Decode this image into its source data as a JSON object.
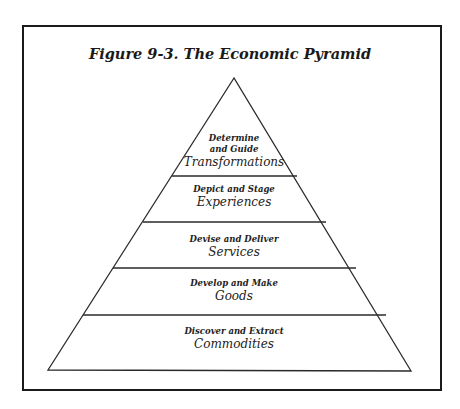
{
  "figure": {
    "title": "Figure 9-3. The Economic Pyramid"
  },
  "pyramid": {
    "levels": [
      {
        "verb_line1": "Determine",
        "verb_line2": "and Guide",
        "noun": "Transformations"
      },
      {
        "verb": "Depict and Stage",
        "noun": "Experiences"
      },
      {
        "verb": "Devise and Deliver",
        "noun": "Services"
      },
      {
        "verb": "Develop and Make",
        "noun": "Goods"
      },
      {
        "verb": "Discover and Extract",
        "noun": "Commodities"
      }
    ]
  }
}
